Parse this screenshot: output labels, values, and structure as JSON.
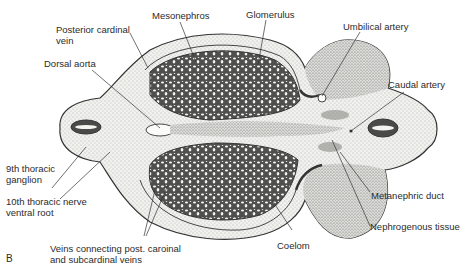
{
  "figure": {
    "panel_letter": "B"
  },
  "labels": {
    "mesonephros": "Mesonephros",
    "glomerulus": "Glomerulus",
    "posterior_cardinal_vein_1": "Posterior cardinal",
    "posterior_cardinal_vein_2": "vein",
    "umbilical_artery": "Umbilical artery",
    "dorsal_aorta": "Dorsal aorta",
    "caudal_artery": "Caudal artery",
    "ninth_thoracic_ganglion_1": "9th thoracic",
    "ninth_thoracic_ganglion_2": "ganglion",
    "tenth_thoracic_nerve_1": "10th thoracic nerve",
    "tenth_thoracic_nerve_2": "ventral root",
    "metanephric_duct": "Metanephric duct",
    "nephrogenous_tissue": "Nephrogenous tissue",
    "coelom": "Coelom",
    "veins_connecting_1": "Veins connecting post. caroinal",
    "veins_connecting_2": "and subcardinal veins"
  },
  "colors": {
    "ink": "#2b2b2b",
    "stipple_fill": "#e6e6e2",
    "dense_fill": "#5a5a58",
    "background": "#ffffff"
  }
}
